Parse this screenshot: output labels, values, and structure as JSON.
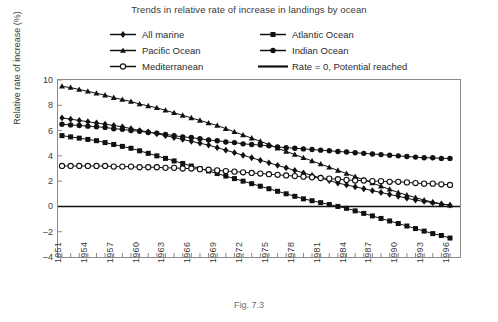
{
  "title": "Trends in relative rate of increase in landings by ocean",
  "caption": "Fig. 7.3",
  "legend": [
    {
      "label": "All marine",
      "marker": "diamond",
      "key": "all-marine"
    },
    {
      "label": "Atlantic Ocean",
      "marker": "square",
      "key": "atlantic-ocean"
    },
    {
      "label": "Pacific Ocean",
      "marker": "triangle",
      "key": "pacific-ocean"
    },
    {
      "label": "Indian Ocean",
      "marker": "circle",
      "key": "indian-ocean"
    },
    {
      "label": "Mediterranean",
      "marker": "open-circle",
      "key": "mediterranean"
    },
    {
      "label": "Rate = 0, Potential reached",
      "marker": "line",
      "key": "zero-line"
    }
  ],
  "chart_data": {
    "type": "line",
    "title": "Trends in relative rate of increase in landings by ocean",
    "xlabel": "",
    "ylabel": "Relative rate of increase (%)",
    "ylim": [
      -4,
      10
    ],
    "yticks": [
      -4,
      -2,
      0,
      2,
      4,
      6,
      8,
      10
    ],
    "xlim": [
      1951,
      1996
    ],
    "xticks": [
      1951,
      1954,
      1957,
      1960,
      1963,
      1966,
      1969,
      1972,
      1975,
      1978,
      1981,
      1984,
      1987,
      1990,
      1993,
      1996
    ],
    "xtick_labels": [
      "1951",
      "1954",
      "1957",
      "1960",
      "1963",
      "1966",
      "1969",
      "1972",
      "1975",
      "1978",
      "1981",
      "1984",
      "1987",
      "1990",
      "1993",
      "1996"
    ],
    "grid": false,
    "legend_position": "top",
    "x": [
      1951,
      1952,
      1953,
      1954,
      1955,
      1956,
      1957,
      1958,
      1959,
      1960,
      1961,
      1962,
      1963,
      1964,
      1965,
      1966,
      1967,
      1968,
      1969,
      1970,
      1971,
      1972,
      1973,
      1974,
      1975,
      1976,
      1977,
      1978,
      1979,
      1980,
      1981,
      1982,
      1983,
      1984,
      1985,
      1986,
      1987,
      1988,
      1989,
      1990,
      1991,
      1992,
      1993,
      1994,
      1995,
      1996
    ],
    "annotations": [
      {
        "text": "Rate = 0, Potential reached",
        "y": 0,
        "type": "hline"
      }
    ],
    "series": [
      {
        "name": "All marine",
        "marker": "diamond",
        "color": "#111111",
        "values": [
          7.0,
          6.9,
          6.8,
          6.7,
          6.6,
          6.5,
          6.4,
          6.3,
          6.15,
          6.0,
          5.9,
          5.75,
          5.6,
          5.45,
          5.3,
          5.15,
          5.0,
          4.85,
          4.65,
          4.45,
          4.25,
          4.05,
          3.85,
          3.65,
          3.45,
          3.25,
          3.05,
          2.85,
          2.65,
          2.45,
          2.25,
          2.05,
          1.85,
          1.7,
          1.55,
          1.4,
          1.25,
          1.1,
          0.95,
          0.8,
          0.65,
          0.5,
          0.4,
          0.3,
          0.2,
          0.1
        ]
      },
      {
        "name": "Atlantic Ocean",
        "marker": "square",
        "color": "#111111",
        "values": [
          5.6,
          5.5,
          5.4,
          5.3,
          5.2,
          5.05,
          4.9,
          4.75,
          4.6,
          4.4,
          4.2,
          4.0,
          3.8,
          3.6,
          3.4,
          3.2,
          3.0,
          2.8,
          2.6,
          2.4,
          2.2,
          2.0,
          1.8,
          1.6,
          1.4,
          1.2,
          1.0,
          0.8,
          0.6,
          0.45,
          0.3,
          0.15,
          0.0,
          -0.15,
          -0.35,
          -0.55,
          -0.75,
          -0.95,
          -1.15,
          -1.35,
          -1.55,
          -1.75,
          -1.95,
          -2.15,
          -2.3,
          -2.5
        ]
      },
      {
        "name": "Pacific Ocean",
        "marker": "triangle",
        "color": "#111111",
        "values": [
          9.5,
          9.4,
          9.25,
          9.1,
          8.95,
          8.8,
          8.6,
          8.45,
          8.3,
          8.1,
          7.95,
          7.8,
          7.6,
          7.4,
          7.2,
          7.0,
          6.8,
          6.6,
          6.4,
          6.15,
          5.9,
          5.65,
          5.4,
          5.15,
          4.9,
          4.6,
          4.35,
          4.1,
          3.85,
          3.6,
          3.35,
          3.1,
          2.85,
          2.6,
          2.35,
          2.1,
          1.85,
          1.6,
          1.35,
          1.1,
          0.9,
          0.7,
          0.5,
          0.35,
          0.2,
          0.1
        ]
      },
      {
        "name": "Indian Ocean",
        "marker": "circle",
        "color": "#111111",
        "values": [
          6.5,
          6.45,
          6.4,
          6.35,
          6.3,
          6.25,
          6.15,
          6.1,
          6.0,
          5.95,
          5.85,
          5.8,
          5.7,
          5.6,
          5.5,
          5.45,
          5.35,
          5.25,
          5.2,
          5.1,
          5.05,
          4.95,
          4.9,
          4.85,
          4.8,
          4.7,
          4.65,
          4.6,
          4.55,
          4.5,
          4.45,
          4.4,
          4.35,
          4.3,
          4.25,
          4.2,
          4.15,
          4.1,
          4.05,
          4.0,
          3.95,
          3.9,
          3.85,
          3.85,
          3.8,
          3.8
        ]
      },
      {
        "name": "Mediterranean",
        "marker": "open-circle",
        "color": "#111111",
        "values": [
          3.2,
          3.2,
          3.2,
          3.2,
          3.2,
          3.2,
          3.15,
          3.15,
          3.15,
          3.1,
          3.1,
          3.1,
          3.05,
          3.05,
          3.0,
          3.0,
          2.95,
          2.9,
          2.85,
          2.8,
          2.75,
          2.7,
          2.65,
          2.6,
          2.55,
          2.5,
          2.45,
          2.4,
          2.35,
          2.3,
          2.25,
          2.2,
          2.15,
          2.1,
          2.05,
          2.05,
          2.0,
          2.0,
          1.95,
          1.95,
          1.9,
          1.85,
          1.8,
          1.8,
          1.75,
          1.7
        ]
      }
    ]
  }
}
